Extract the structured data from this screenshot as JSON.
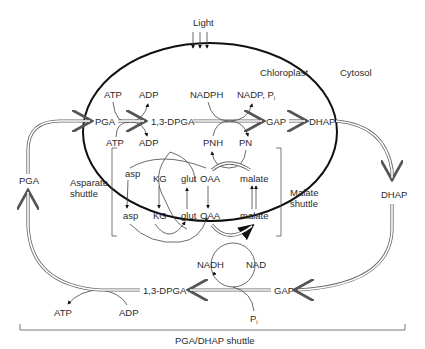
{
  "diagram": {
    "compartments": {
      "chloroplast": "Chloroplast",
      "cytosol": "Cytosol"
    },
    "light": "Light",
    "chloroplast_reactions": {
      "pga": "PGA",
      "dpga": "1,3-DPGA",
      "gap": "GAP",
      "dhap": "DHAP",
      "atp_top": "ATP",
      "adp_top": "ADP",
      "atp_bottom": "ATP",
      "adp_bottom": "ADP",
      "nadph": "NADPH",
      "nadp_pi": "NADP, P",
      "nadp_pi_sub": "i",
      "pnh": "PNH",
      "pn": "PN"
    },
    "asparate_shuttle": {
      "label_line1": "Asparate",
      "label_line2": "shuttle",
      "inner": [
        "asp",
        "KG",
        "glut"
      ],
      "outer": [
        "asp",
        "KG",
        "glut"
      ]
    },
    "malate_shuttle": {
      "label_line1": "Malate",
      "label_line2": "shuttle",
      "oaa_inner": "OAA",
      "malate_inner": "malate",
      "oaa_outer": "OAA",
      "malate_outer": "malate"
    },
    "cytosol_reactions": {
      "pga": "PGA",
      "dhap": "DHAP",
      "gap": "GAP",
      "dpga": "1,3-DPGA",
      "nadh": "NADH",
      "nad": "NAD",
      "pi": "P",
      "pi_sub": "i",
      "atp": "ATP",
      "adp": "ADP"
    },
    "bottom_label": "PGA/DHAP shuttle"
  }
}
